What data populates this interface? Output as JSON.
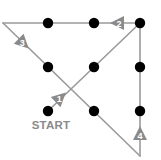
{
  "diagram": {
    "start_label": "START",
    "colors": {
      "line": "#9a9a9a",
      "dot": "#000000",
      "arrow": "#8a8a8a",
      "arrow_text": "#ffffff",
      "label": "#8a8a8a"
    },
    "dots": [
      {
        "x": 48,
        "y": 23
      },
      {
        "x": 94,
        "y": 23
      },
      {
        "x": 140,
        "y": 23
      },
      {
        "x": 48,
        "y": 67
      },
      {
        "x": 94,
        "y": 67
      },
      {
        "x": 140,
        "y": 67
      },
      {
        "x": 48,
        "y": 111
      },
      {
        "x": 94,
        "y": 111
      },
      {
        "x": 140,
        "y": 111
      }
    ],
    "path_vertices": [
      {
        "x": 48,
        "y": 111
      },
      {
        "x": 140,
        "y": 23
      },
      {
        "x": 3,
        "y": 23
      },
      {
        "x": 140,
        "y": 156
      },
      {
        "x": 140,
        "y": 23
      }
    ],
    "arrows": [
      {
        "step": "1",
        "x": 60,
        "y": 98,
        "direction": "up-right"
      },
      {
        "step": "2",
        "x": 118,
        "y": 23,
        "direction": "left"
      },
      {
        "step": "3",
        "x": 23,
        "y": 43,
        "direction": "down-right"
      },
      {
        "step": "4",
        "x": 140,
        "y": 134,
        "direction": "up"
      }
    ]
  }
}
